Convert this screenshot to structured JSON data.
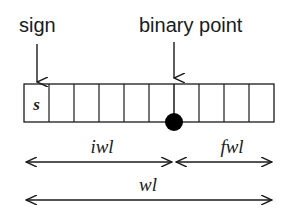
{
  "labels": {
    "sign": "sign",
    "binary_point": "binary point",
    "sign_bit": "s",
    "iwl": "iwl",
    "fwl": "fwl",
    "wl": "wl"
  },
  "register": {
    "total_cells": 10,
    "integer_cells": 6,
    "fraction_cells": 4
  },
  "colors": {
    "stroke": "#1a1a1a",
    "background": "#ffffff"
  }
}
